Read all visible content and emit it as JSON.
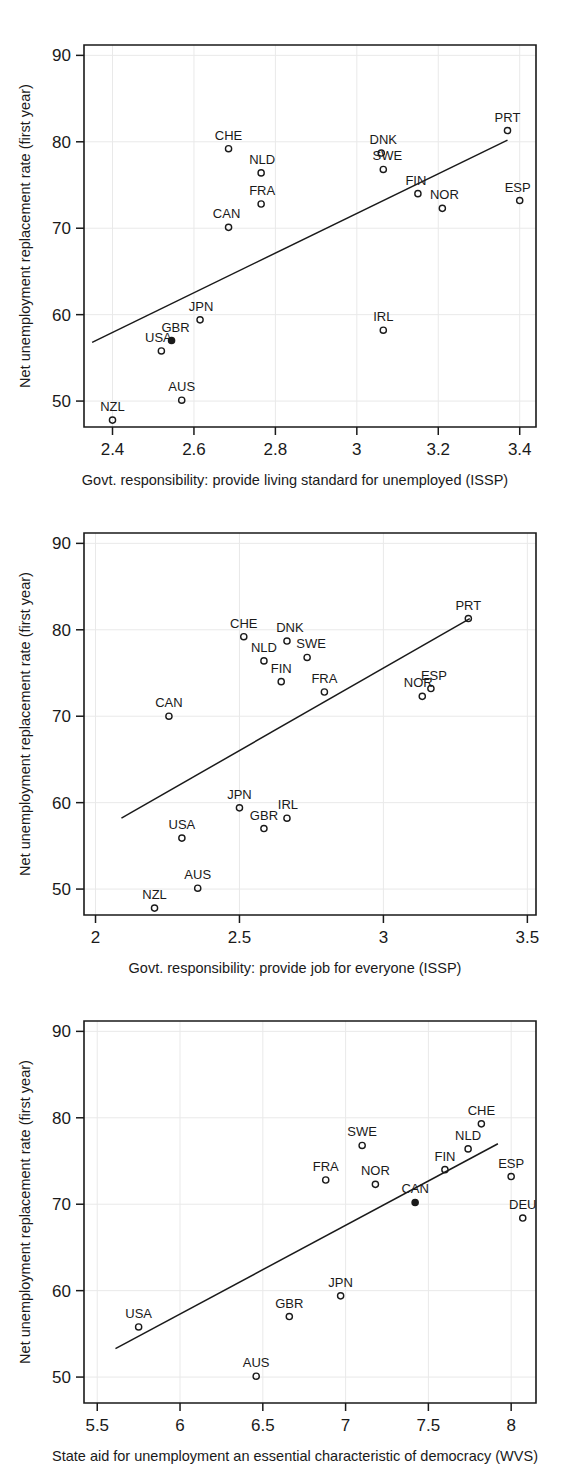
{
  "figure": {
    "kind": "three-panel-scatter-figure",
    "panel_count": 3,
    "shared_ylabel": "Net unemployment replacement rate (first year)"
  },
  "chart_data": [
    {
      "type": "scatter",
      "panel": 1,
      "title": "",
      "xlabel": "Govt. responsibility: provide living standard for unemployed (ISSP)",
      "ylabel": "Net unemployment replacement rate (first year)",
      "xlim": [
        2.33,
        3.44
      ],
      "ylim": [
        47.0,
        91.2
      ],
      "xticks": [
        2.4,
        2.6,
        2.8,
        3,
        3.2,
        3.4
      ],
      "xticklabels": [
        "2.4",
        "2.6",
        "2.8",
        "3",
        "3.2",
        "3.4"
      ],
      "yticks": [
        50,
        60,
        70,
        80,
        90
      ],
      "yticklabels": [
        "50",
        "60",
        "70",
        "80",
        "90"
      ],
      "grid": false,
      "legend": "none",
      "fit_line": {
        "x": [
          2.35,
          3.37
        ],
        "y": [
          56.8,
          80.2
        ]
      },
      "points": [
        {
          "label": "NZL",
          "x": 2.4,
          "y": 47.8,
          "label_dx": 0,
          "label_dy": -9
        },
        {
          "label": "AUS",
          "x": 2.57,
          "y": 50.1,
          "label_dx": 0,
          "label_dy": -9
        },
        {
          "label": "USA",
          "x": 2.52,
          "y": 55.8,
          "label_dx": -3,
          "label_dy": -9
        },
        {
          "label": "GBR",
          "x": 2.545,
          "y": 57.0,
          "label_dx": 4,
          "label_dy": -9
        },
        {
          "label": "JPN",
          "x": 2.615,
          "y": 59.4,
          "label_dx": 1,
          "label_dy": -9
        },
        {
          "label": "IRL",
          "x": 3.065,
          "y": 58.2,
          "label_dx": 0,
          "label_dy": -9
        },
        {
          "label": "CAN",
          "x": 2.685,
          "y": 70.1,
          "label_dx": -2,
          "label_dy": -9
        },
        {
          "label": "NOR",
          "x": 3.21,
          "y": 72.3,
          "label_dx": 2,
          "label_dy": -9
        },
        {
          "label": "FRA",
          "x": 2.765,
          "y": 72.8,
          "label_dx": 1,
          "label_dy": -9
        },
        {
          "label": "ESP",
          "x": 3.4,
          "y": 73.2,
          "label_dx": -2,
          "label_dy": -9
        },
        {
          "label": "FIN",
          "x": 3.15,
          "y": 74.0,
          "label_dx": -2,
          "label_dy": -9
        },
        {
          "label": "NLD",
          "x": 2.765,
          "y": 76.4,
          "label_dx": 1,
          "label_dy": -9
        },
        {
          "label": "SWE",
          "x": 3.065,
          "y": 76.8,
          "label_dx": 4,
          "label_dy": -9
        },
        {
          "label": "DNK",
          "x": 3.06,
          "y": 78.7,
          "label_dx": 2,
          "label_dy": -9
        },
        {
          "label": "CHE",
          "x": 2.685,
          "y": 79.2,
          "label_dx": 0,
          "label_dy": -9
        },
        {
          "label": "PRT",
          "x": 3.37,
          "y": 81.3,
          "label_dx": 0,
          "label_dy": -9
        }
      ]
    },
    {
      "type": "scatter",
      "panel": 2,
      "title": "",
      "xlabel": "Govt. responsibility: provide job for everyone (ISSP)",
      "ylabel": "Net unemployment replacement rate (first year)",
      "xlim": [
        1.96,
        3.53
      ],
      "ylim": [
        47.0,
        91.2
      ],
      "xticks": [
        2,
        2.5,
        3,
        3.5
      ],
      "xticklabels": [
        "2",
        "2.5",
        "3",
        "3.5"
      ],
      "yticks": [
        50,
        60,
        70,
        80,
        90
      ],
      "yticklabels": [
        "50",
        "60",
        "70",
        "80",
        "90"
      ],
      "grid": false,
      "legend": "none",
      "fit_line": {
        "x": [
          2.09,
          3.3
        ],
        "y": [
          58.2,
          81.3
        ]
      },
      "points": [
        {
          "label": "NZL",
          "x": 2.205,
          "y": 47.8,
          "label_dx": 0,
          "label_dy": -9
        },
        {
          "label": "AUS",
          "x": 2.355,
          "y": 50.1,
          "label_dx": 0,
          "label_dy": -9
        },
        {
          "label": "USA",
          "x": 2.3,
          "y": 55.9,
          "label_dx": 0,
          "label_dy": -9
        },
        {
          "label": "GBR",
          "x": 2.585,
          "y": 57.0,
          "label_dx": 0,
          "label_dy": -9
        },
        {
          "label": "IRL",
          "x": 2.665,
          "y": 58.2,
          "label_dx": 1,
          "label_dy": -9
        },
        {
          "label": "JPN",
          "x": 2.5,
          "y": 59.4,
          "label_dx": 0,
          "label_dy": -9
        },
        {
          "label": "CAN",
          "x": 2.255,
          "y": 70.0,
          "label_dx": 0,
          "label_dy": -9
        },
        {
          "label": "NOR",
          "x": 3.135,
          "y": 72.3,
          "label_dx": -4,
          "label_dy": -9
        },
        {
          "label": "ESP",
          "x": 3.165,
          "y": 73.2,
          "label_dx": 3,
          "label_dy": -9
        },
        {
          "label": "FRA",
          "x": 2.795,
          "y": 72.8,
          "label_dx": 0,
          "label_dy": -9
        },
        {
          "label": "FIN",
          "x": 2.645,
          "y": 74.0,
          "label_dx": 0,
          "label_dy": -9
        },
        {
          "label": "NLD",
          "x": 2.585,
          "y": 76.4,
          "label_dx": 0,
          "label_dy": -9
        },
        {
          "label": "SWE",
          "x": 2.735,
          "y": 76.8,
          "label_dx": 4,
          "label_dy": -9
        },
        {
          "label": "DNK",
          "x": 2.665,
          "y": 78.7,
          "label_dx": 3,
          "label_dy": -9
        },
        {
          "label": "CHE",
          "x": 2.515,
          "y": 79.2,
          "label_dx": 0,
          "label_dy": -9
        },
        {
          "label": "PRT",
          "x": 3.295,
          "y": 81.3,
          "label_dx": 0,
          "label_dy": -9
        }
      ]
    },
    {
      "type": "scatter",
      "panel": 3,
      "title": "",
      "xlabel": "State aid for unemployment an essential characteristic of democracy (WVS)",
      "ylabel": "Net unemployment replacement rate (first year)",
      "xlim": [
        5.42,
        8.15
      ],
      "ylim": [
        47.0,
        91.2
      ],
      "xticks": [
        5.5,
        6,
        6.5,
        7,
        7.5,
        8
      ],
      "xticklabels": [
        "5.5",
        "6",
        "6.5",
        "7",
        "7.5",
        "8"
      ],
      "yticks": [
        50,
        60,
        70,
        80,
        90
      ],
      "yticklabels": [
        "50",
        "60",
        "70",
        "80",
        "90"
      ],
      "grid": false,
      "legend": "none",
      "fit_line": {
        "x": [
          5.61,
          7.92
        ],
        "y": [
          53.3,
          77.0
        ]
      },
      "points": [
        {
          "label": "AUS",
          "x": 6.46,
          "y": 50.1,
          "label_dx": 0,
          "label_dy": -9
        },
        {
          "label": "USA",
          "x": 5.75,
          "y": 55.8,
          "label_dx": 0,
          "label_dy": -9
        },
        {
          "label": "GBR",
          "x": 6.66,
          "y": 57.0,
          "label_dx": 0,
          "label_dy": -9
        },
        {
          "label": "JPN",
          "x": 6.97,
          "y": 59.4,
          "label_dx": 0,
          "label_dy": -9
        },
        {
          "label": "DEU",
          "x": 8.07,
          "y": 68.4,
          "label_dx": 0,
          "label_dy": -9
        },
        {
          "label": "CAN",
          "x": 7.42,
          "y": 70.2,
          "label_dx": 0,
          "label_dy": -9
        },
        {
          "label": "NOR",
          "x": 7.18,
          "y": 72.3,
          "label_dx": 0,
          "label_dy": -9
        },
        {
          "label": "FRA",
          "x": 6.88,
          "y": 72.8,
          "label_dx": 0,
          "label_dy": -9
        },
        {
          "label": "ESP",
          "x": 8.0,
          "y": 73.2,
          "label_dx": 0,
          "label_dy": -9
        },
        {
          "label": "FIN",
          "x": 7.6,
          "y": 74.0,
          "label_dx": 0,
          "label_dy": -9
        },
        {
          "label": "NLD",
          "x": 7.74,
          "y": 76.4,
          "label_dx": 0,
          "label_dy": -9
        },
        {
          "label": "SWE",
          "x": 7.1,
          "y": 76.8,
          "label_dx": 0,
          "label_dy": -9
        },
        {
          "label": "CHE",
          "x": 7.82,
          "y": 79.3,
          "label_dx": 0,
          "label_dy": -9
        }
      ]
    }
  ]
}
